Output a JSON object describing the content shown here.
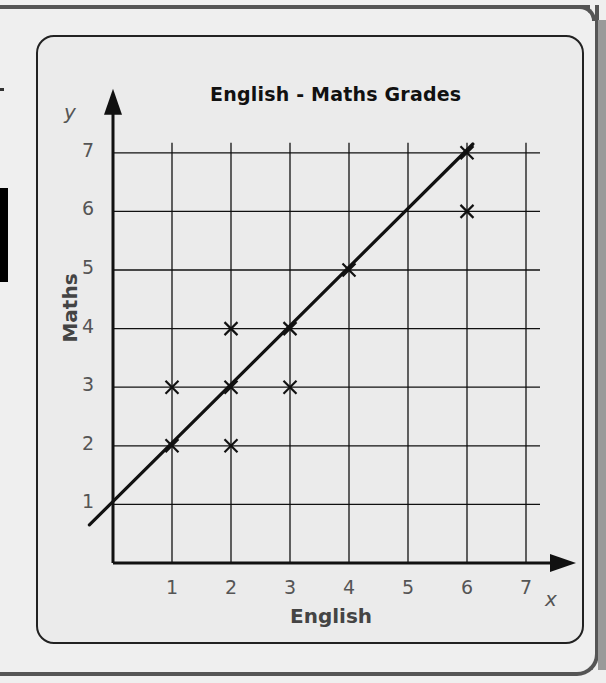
{
  "chart_data": {
    "type": "scatter",
    "title": "English - Maths Grades",
    "xlabel": "English",
    "ylabel": "Maths",
    "x_axis_variable": "x",
    "y_axis_variable": "y",
    "xlim": [
      0,
      7
    ],
    "ylim": [
      0,
      7
    ],
    "x_ticks": [
      "1",
      "2",
      "3",
      "4",
      "5",
      "6",
      "7"
    ],
    "y_ticks": [
      "1",
      "2",
      "3",
      "4",
      "5",
      "6",
      "7"
    ],
    "grid": true,
    "marker": "x",
    "points": [
      {
        "x": 1,
        "y": 2
      },
      {
        "x": 1,
        "y": 3
      },
      {
        "x": 2,
        "y": 2
      },
      {
        "x": 2,
        "y": 3
      },
      {
        "x": 2,
        "y": 4
      },
      {
        "x": 3,
        "y": 3
      },
      {
        "x": 3,
        "y": 4
      },
      {
        "x": 4,
        "y": 5
      },
      {
        "x": 6,
        "y": 6
      },
      {
        "x": 6,
        "y": 7
      }
    ],
    "line_of_best_fit": {
      "from": [
        -0.4,
        0.65
      ],
      "to": [
        6.1,
        7.15
      ],
      "equation": "y = x + 1"
    }
  },
  "colors": {
    "ink": "#111111",
    "tick_text": "#555555",
    "panel_border": "#222222",
    "page_background": "#efefef"
  }
}
